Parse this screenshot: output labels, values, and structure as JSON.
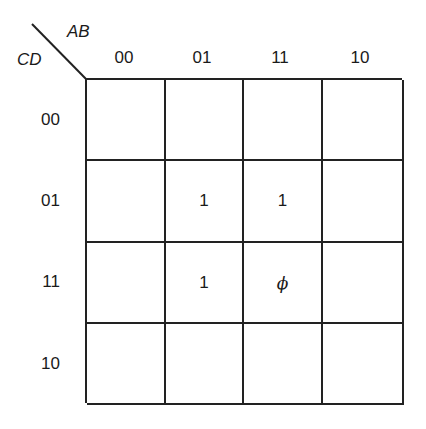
{
  "kmap": {
    "row_variable": "CD",
    "col_variable": "AB",
    "col_labels": [
      "00",
      "01",
      "11",
      "10"
    ],
    "row_labels": [
      "00",
      "01",
      "11",
      "10"
    ],
    "cells": [
      [
        "",
        "",
        "",
        ""
      ],
      [
        "",
        "1",
        "1",
        ""
      ],
      [
        "",
        "1",
        "ϕ",
        ""
      ],
      [
        "",
        "",
        "",
        ""
      ]
    ]
  }
}
